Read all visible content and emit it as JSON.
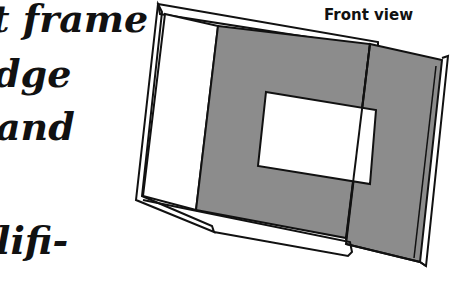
{
  "body_text": {
    "lines": [
      "t frame",
      "dge",
      "and",
      "lifi-"
    ]
  },
  "illustration": {
    "caption": "Front view",
    "colors": {
      "mat": "#8c8c8c",
      "line": "#111111",
      "paper": "#ffffff"
    }
  }
}
